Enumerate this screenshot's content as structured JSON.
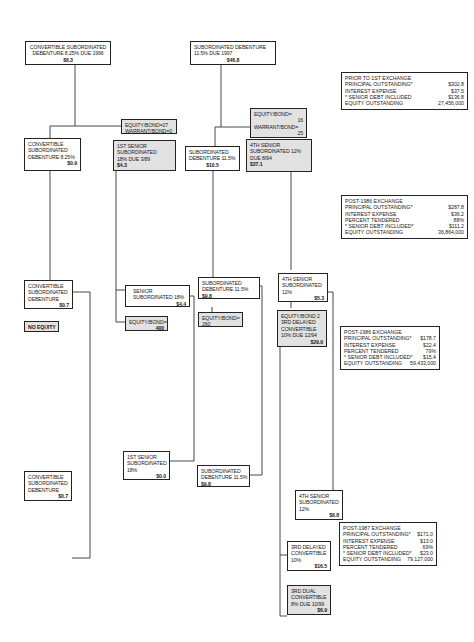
{
  "securities": {
    "conv_sub_top": {
      "lines": [
        "CONVERTIBLE SUBORDINATED",
        "DEBENTURE 8.25% DUE 1996"
      ],
      "amount": "$6.3"
    },
    "sub_deb_top": {
      "lines": [
        "SUBORDINATED DEBENTURE",
        "11.5% DUE 1997"
      ],
      "amount": "$46.8"
    },
    "eq_warrant_1": {
      "lines": [
        "EQUITY/BOND=27",
        "WARRANT/BOND=0"
      ]
    },
    "eq_warrant_2": {
      "lines": [
        "EQUITY/BOND=",
        "16",
        "WARRANT/BOND=",
        "25"
      ]
    },
    "conv_sub_1": {
      "lines": [
        "CONVERTIBLE",
        "SUBORDINATED",
        "DEBENTURE 8.25%"
      ],
      "amount": "$0.9"
    },
    "first_senior_1": {
      "lines": [
        "1ST SENIOR",
        "SUBORDINATED",
        "18% DUE 3/89"
      ],
      "amount": "$4.3"
    },
    "sub_deb_1": {
      "lines": [
        "SUBORDINATED",
        "DEBENTURE 11.5%"
      ],
      "amount": "$10.5"
    },
    "fourth_senior_1": {
      "lines": [
        "4TH SENIOR",
        "SUBORDINATED 12%",
        "DUE 8/94"
      ],
      "amount": "$37.1"
    },
    "conv_sub_2": {
      "lines": [
        "CONVERTIBLE",
        "SUBORDINATED",
        "DEBENTURE"
      ],
      "amount": "$0.7"
    },
    "no_equity": {
      "lines": [
        "NO EQUITY"
      ]
    },
    "senior_sub_18": {
      "lines": [
        "SENIOR",
        "SUBORDINATED 18%"
      ],
      "amount": "$4.4"
    },
    "equity_bond_400": {
      "lines": [
        "EQUITY/BOND="
      ],
      "amount": "400"
    },
    "sub_deb_2": {
      "lines": [
        "SUBORDINATED",
        "DEBENTURE 11.5%"
      ],
      "amount": "$9.8"
    },
    "equity_bond_260": {
      "lines": [
        "EQUITY/BOND=",
        "260"
      ]
    },
    "fourth_senior_2": {
      "lines": [
        "4TH SENIOR",
        "SUBORDINATED",
        "12%"
      ],
      "amount": "$5.3"
    },
    "third_delayed_1": {
      "lines": [
        "EQUITY/BOND 2",
        "3RD DELAYED",
        "CONVERTIBLE",
        "10% DUE 12/94"
      ],
      "amount": "$29.0"
    },
    "conv_sub_3": {
      "lines": [
        "CONVERTIBLE",
        "SUBORDINATED",
        "DEBENTURE"
      ],
      "amount": "$0.7"
    },
    "first_senior_2": {
      "lines": [
        "1ST SENIOR",
        "SUBORDINATED",
        "18%"
      ],
      "amount": "$0.0"
    },
    "sub_deb_3": {
      "lines": [
        "SUBORDINATED",
        "DEBENTURE 11.5%"
      ],
      "amount": "$9.8"
    },
    "fourth_senior_3": {
      "lines": [
        "4TH SENIOR",
        "SUBORDINATED",
        "12%"
      ],
      "amount": "$6.8"
    },
    "third_delayed_2": {
      "lines": [
        "3RD DELAYED",
        "CONVERTIBLE",
        "10%"
      ],
      "amount": "$16.5"
    },
    "third_dual": {
      "lines": [
        "3RD DUAL",
        "CONVERTIBLE",
        "8% DUE 10/99"
      ],
      "amount": "$6.9"
    }
  },
  "stats": {
    "prior_first": {
      "title": "PRIOR TO 1ST EXCHANGE",
      "rows": [
        {
          "label": "PRINCIPAL OUTSTANDING*",
          "value": "$302.8"
        },
        {
          "label": "INTEREST EXPENSE",
          "value": "$37.5"
        },
        {
          "label": "* SENIOR DEBT INCLUDED",
          "value": "$136.8"
        },
        {
          "label": "EQUITY OUTSTANDING",
          "value": "27,456,000"
        }
      ]
    },
    "post_1986_a": {
      "title": "POST-1986 EXCHANGE",
      "rows": [
        {
          "label": "PRINCIPAL OUTSTANDING*",
          "value": "$287.8"
        },
        {
          "label": "INTEREST EXPENSE",
          "value": "$36.2"
        },
        {
          "label": "PERCENT TENDERED",
          "value": "88%"
        },
        {
          "label": "* SENIOR DEBT INCLUDED*",
          "value": "$111.2"
        },
        {
          "label": "EQUITY OUTSTANDING",
          "value": "36,864,000"
        }
      ]
    },
    "post_1986_b": {
      "title": "POST-1986 EXCHANGE",
      "rows": [
        {
          "label": "PRINCIPAL OUTSTANDING*",
          "value": "$178.7"
        },
        {
          "label": "INTEREST EXPENSE",
          "value": "$22.4"
        },
        {
          "label": "PERCENT TENDERED",
          "value": "79%"
        },
        {
          "label": "* SENIOR DEBT INCLUDED*",
          "value": "$15.4"
        },
        {
          "label": "EQUITY OUTSTANDING",
          "value": "59,433,000"
        }
      ]
    },
    "post_1987": {
      "title": "POST-1987 EXCHANGE",
      "rows": [
        {
          "label": "PRINCIPAL OUTSTANDING*",
          "value": "$171.0"
        },
        {
          "label": "INTEREST EXPENSE",
          "value": "$13.0"
        },
        {
          "label": "PERCENT TENDERED",
          "value": "69%"
        },
        {
          "label": "* SENIOR DEBT INCLUDED*",
          "value": "$23.0"
        },
        {
          "label": "EQUITY OUTSTANDING",
          "value": "79,127,000"
        }
      ]
    }
  },
  "colors": {
    "line": "#333333",
    "shaded": "#e2e2e2",
    "border": "#222222"
  }
}
